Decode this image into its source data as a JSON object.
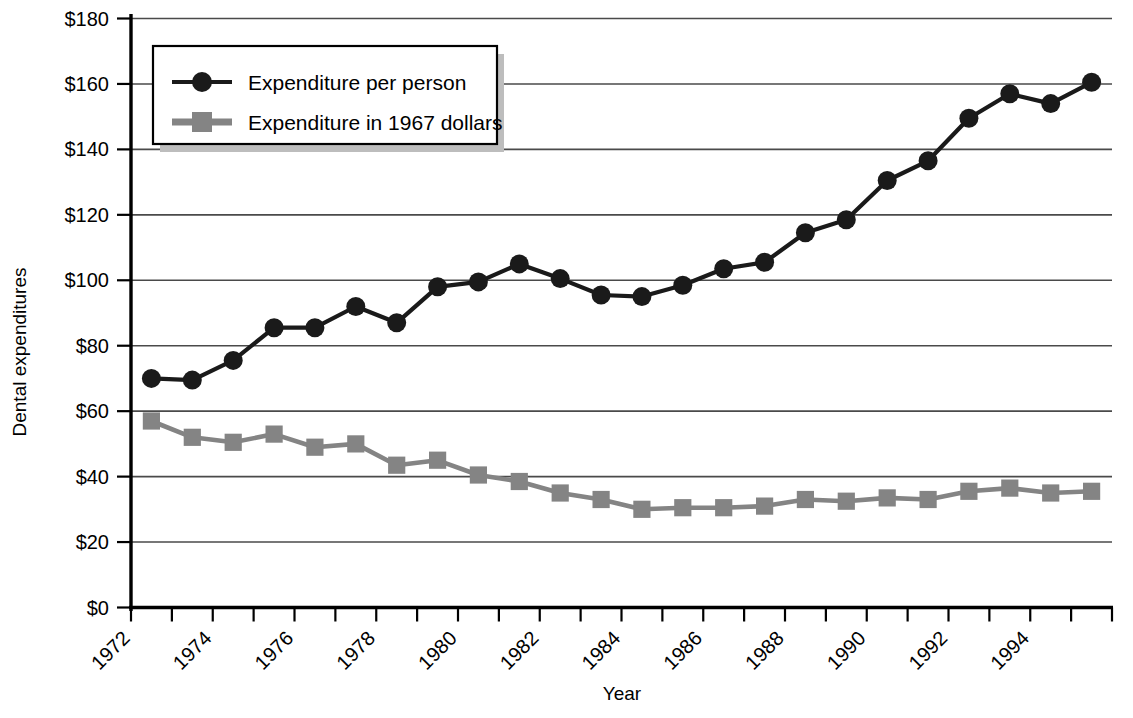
{
  "chart_data": {
    "type": "line",
    "title": "",
    "xlabel": "Year",
    "ylabel": "Dental expenditures",
    "ylim": [
      0,
      180
    ],
    "ytick_step": 20,
    "grid": true,
    "legend_position": "top-left",
    "categories": [
      "1972",
      "1973",
      "1974",
      "1975",
      "1976",
      "1977",
      "1978",
      "1979",
      "1980",
      "1981",
      "1982",
      "1983",
      "1984",
      "1985",
      "1986",
      "1987",
      "1988",
      "1989",
      "1990",
      "1991",
      "1992",
      "1993",
      "1994",
      "1995"
    ],
    "xtick_labels": [
      "1972",
      "1974",
      "1976",
      "1978",
      "1980",
      "1982",
      "1984",
      "1986",
      "1988",
      "1990",
      "1992",
      "1994"
    ],
    "ytick_labels": [
      "$0",
      "$20",
      "$40",
      "$60",
      "$80",
      "$100",
      "$120",
      "$140",
      "$160",
      "$180"
    ],
    "series": [
      {
        "name": "Expenditure per person",
        "marker": "circle",
        "color": "#1a1a1a",
        "values": [
          70,
          69.5,
          75.5,
          85.5,
          85.5,
          92,
          87,
          98,
          99.5,
          105,
          100.5,
          95.5,
          95,
          98.5,
          103.5,
          105.5,
          114.5,
          118.5,
          130.5,
          136.5,
          149.5,
          157,
          154,
          160.5
        ]
      },
      {
        "name": "Expenditure in 1967 dollars",
        "marker": "square",
        "color": "#848484",
        "values": [
          57,
          52,
          50.5,
          53,
          49,
          50,
          43.5,
          45,
          40.5,
          38.5,
          35,
          33,
          30,
          30.5,
          30.5,
          31,
          33,
          32.5,
          33.5,
          33,
          35.5,
          36.5,
          35,
          35.5
        ]
      }
    ]
  },
  "legend": {
    "items": [
      {
        "label": "Expenditure per person",
        "marker": "circle",
        "color": "#1a1a1a"
      },
      {
        "label": "Expenditure in 1967 dollars",
        "marker": "square",
        "color": "#848484"
      }
    ]
  },
  "axes": {
    "y_title": "Dental expenditures",
    "x_title": "Year"
  },
  "colors": {
    "series_1": "#1a1a1a",
    "series_2": "#848484",
    "grid": "#4a4a4a",
    "axis": "#000000",
    "legend_shadow": "#bdbdbd",
    "background": "#ffffff"
  }
}
